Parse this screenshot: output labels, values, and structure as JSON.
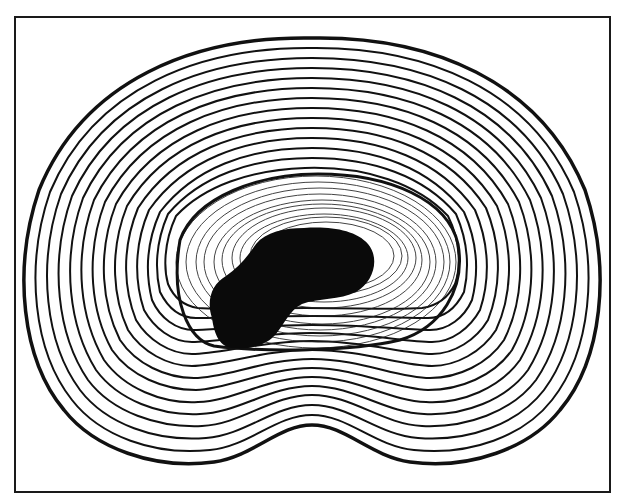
{
  "figure": {
    "annulus_ring_count": 26,
    "colors": {
      "ink": "#111111",
      "paper": "#ffffff"
    },
    "labels": []
  }
}
